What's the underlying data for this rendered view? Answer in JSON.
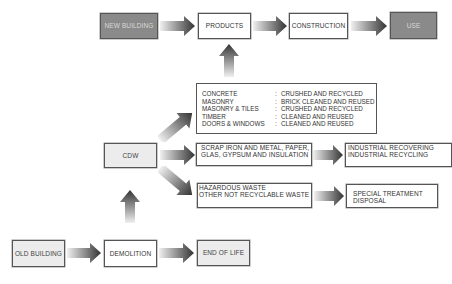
{
  "diagram": {
    "colors": {
      "dark_box_fill": "#8a8a8a",
      "light_box_fill": "#ececec",
      "border": "#555555",
      "arrow_dark": "#3a3a3a",
      "arrow_light": "#e6e6e6"
    },
    "top_row": {
      "new_building": "NEW BUILDING",
      "products": "PRODUCTS",
      "construction": "CONSTRUCTION",
      "use": "USE"
    },
    "materials": {
      "rows": [
        {
          "material": "CONCRETE",
          "sep": ":",
          "treatment": "CRUSHED AND RECYCLED"
        },
        {
          "material": "MASONRY",
          "sep": ":",
          "treatment": "BRICK CLEANED AND REUSED"
        },
        {
          "material": "MASONRY & TILES",
          "sep": ":",
          "treatment": "CRUSHED AND RECYCLED"
        },
        {
          "material": "TIMBER",
          "sep": ":",
          "treatment": "CLEANED AND REUSED"
        },
        {
          "material": "DOORS &  WINDOWS",
          "sep": ":",
          "treatment": "CLEANED AND REUSED"
        }
      ]
    },
    "cdw": "CDW",
    "scrap": {
      "line1": "SCRAP IRON AND METAL, PAPER,",
      "line2": "GLAS, GYPSUM AND INSULATION"
    },
    "industrial": {
      "line1": "INDUSTRIAL RECOVERING",
      "line2": "INDUSTRIAL RECYCLING"
    },
    "hazardous": {
      "line1": "HAZARDOUS WASTE",
      "line2": "OTHER NOT RECYCLABLE WASTE"
    },
    "special": {
      "line1": "SPECIAL TREATMENT",
      "line2": "DISPOSAL"
    },
    "bottom_row": {
      "old_building": "OLD BUILDING",
      "demolition": "DEMOLITION",
      "end_of_life": "END OF LIFE"
    }
  }
}
